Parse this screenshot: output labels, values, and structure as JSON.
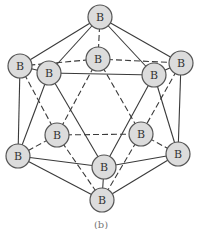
{
  "figure": {
    "caption": "(b)"
  },
  "atoms": [
    {
      "id": "top",
      "label": "B"
    },
    {
      "id": "upper-back",
      "label": "B"
    },
    {
      "id": "upper-left",
      "label": "B"
    },
    {
      "id": "upper-front-left",
      "label": "B"
    },
    {
      "id": "upper-front-right",
      "label": "B"
    },
    {
      "id": "upper-right",
      "label": "B"
    },
    {
      "id": "lower-back-left",
      "label": "B"
    },
    {
      "id": "lower-back-right",
      "label": "B"
    },
    {
      "id": "lower-left",
      "label": "B"
    },
    {
      "id": "lower-front",
      "label": "B"
    },
    {
      "id": "lower-right",
      "label": "B"
    },
    {
      "id": "bottom",
      "label": "B"
    }
  ],
  "bonds": {
    "solid": [
      [
        "top",
        "upper-left"
      ],
      [
        "top",
        "upper-front-left"
      ],
      [
        "top",
        "upper-front-right"
      ],
      [
        "top",
        "upper-right"
      ],
      [
        "upper-left",
        "upper-front-left"
      ],
      [
        "upper-front-left",
        "upper-front-right"
      ],
      [
        "upper-front-right",
        "upper-right"
      ],
      [
        "upper-left",
        "lower-left"
      ],
      [
        "upper-right",
        "lower-right"
      ],
      [
        "upper-front-left",
        "lower-left"
      ],
      [
        "upper-front-left",
        "lower-front"
      ],
      [
        "upper-front-right",
        "lower-front"
      ],
      [
        "upper-front-right",
        "lower-right"
      ],
      [
        "lower-left",
        "lower-front"
      ],
      [
        "lower-front",
        "lower-right"
      ],
      [
        "lower-left",
        "bottom"
      ],
      [
        "lower-front",
        "bottom"
      ],
      [
        "lower-right",
        "bottom"
      ]
    ],
    "dashed": [
      [
        "top",
        "upper-back"
      ],
      [
        "upper-back",
        "upper-left"
      ],
      [
        "upper-back",
        "upper-right"
      ],
      [
        "upper-back",
        "lower-back-left"
      ],
      [
        "upper-back",
        "lower-back-right"
      ],
      [
        "upper-left",
        "lower-back-left"
      ],
      [
        "upper-right",
        "lower-back-right"
      ],
      [
        "lower-back-left",
        "lower-back-right"
      ],
      [
        "lower-back-left",
        "lower-left"
      ],
      [
        "lower-back-right",
        "lower-right"
      ],
      [
        "lower-back-left",
        "bottom"
      ],
      [
        "lower-back-right",
        "bottom"
      ]
    ]
  }
}
